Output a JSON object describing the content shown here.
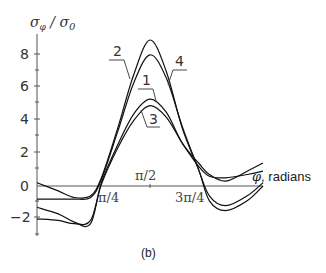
{
  "chart_data": {
    "type": "line",
    "title": "",
    "panel_label": "(b)",
    "xlabel": "φ, radians",
    "ylabel": "σφ / σ0",
    "xticks": [
      {
        "label": "π/4",
        "value": 0.7854
      },
      {
        "label": "π/2",
        "value": 1.5708
      },
      {
        "label": "3π/4",
        "value": 2.3562
      }
    ],
    "yticks": [
      -2,
      0,
      2,
      4,
      6,
      8
    ],
    "ylim": [
      -3,
      9
    ],
    "xlim": [
      0,
      3.3
    ],
    "grid": false,
    "legend": "curve numbers labeled with leader lines",
    "x_units": "multiples of π/4",
    "series": [
      {
        "name": "2",
        "x": [
          -0.1,
          0.3,
          0.6,
          0.9,
          1.1,
          1.4,
          1.7,
          2.0,
          2.3,
          2.6,
          2.9,
          3.1,
          3.4,
          3.8,
          4.1
        ],
        "values": [
          0.2,
          -0.3,
          -0.7,
          -0.6,
          0.5,
          3.5,
          6.8,
          8.9,
          7.0,
          3.5,
          1.0,
          -0.9,
          -1.5,
          -0.9,
          0.0
        ]
      },
      {
        "name": "4",
        "x": [
          -0.1,
          0.3,
          0.6,
          0.9,
          1.1,
          1.4,
          1.7,
          2.0,
          2.3,
          2.6,
          2.9,
          3.1,
          3.4,
          3.8,
          4.1
        ],
        "values": [
          -0.8,
          -0.8,
          -0.8,
          -0.7,
          0.4,
          3.3,
          6.3,
          8.0,
          6.6,
          3.6,
          1.0,
          -0.6,
          -1.2,
          -0.6,
          0.2
        ]
      },
      {
        "name": "1",
        "x": [
          -0.1,
          0.3,
          0.6,
          0.9,
          1.1,
          1.4,
          1.7,
          2.0,
          2.3,
          2.6,
          2.9,
          3.1,
          3.4,
          3.8,
          4.1
        ],
        "values": [
          -1.3,
          -1.7,
          -2.2,
          -2.3,
          0.2,
          2.5,
          4.4,
          5.3,
          4.5,
          2.6,
          1.4,
          0.7,
          0.3,
          0.9,
          1.4
        ]
      },
      {
        "name": "3",
        "x": [
          -0.1,
          0.3,
          0.6,
          0.9,
          1.1,
          1.4,
          1.7,
          2.0,
          2.3,
          2.6,
          2.9,
          3.1,
          3.4,
          3.8,
          4.1
        ],
        "values": [
          -2.0,
          -2.1,
          -2.3,
          -2.1,
          0.1,
          2.3,
          4.0,
          4.9,
          4.2,
          2.6,
          1.2,
          0.6,
          0.5,
          0.7,
          0.9
        ]
      }
    ],
    "curve_labels": [
      {
        "text": "2",
        "x": 113,
        "y": 37
      },
      {
        "text": "4",
        "x": 175,
        "y": 65
      },
      {
        "text": "1",
        "x": 142,
        "y": 80
      },
      {
        "text": "3",
        "x": 149,
        "y": 118
      }
    ]
  },
  "labels": {
    "ylabel_main": "σ",
    "ylabel_sub": "φ",
    "ylabel_div": " / σ",
    "ylabel_sub0": "0",
    "xlabel_phi": "φ",
    "xlabel_text": ", radians",
    "panel": "(b)",
    "yt8": "8",
    "yt6": "6",
    "yt4": "4",
    "yt2": "2",
    "yt0": "0",
    "ytm2": "−2",
    "xt1": "π/4",
    "xt2": "π/2",
    "xt3": "3π/4",
    "c1": "1",
    "c2": "2",
    "c3": "3",
    "c4": "4"
  }
}
